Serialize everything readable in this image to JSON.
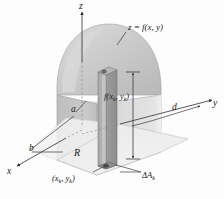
{
  "figure": {
    "labels": {
      "z_axis": "z",
      "y_axis": "y",
      "x_axis": "x",
      "surface_equation": "z = f(x, y)",
      "side_a": "a",
      "side_b": "b",
      "side_d": "d",
      "region": "R",
      "sample_point": "(x",
      "sample_point_sub1": "k",
      "sample_point_mid": ", y",
      "sample_point_sub2": "k",
      "sample_point_end": ")",
      "height_label": "f(x",
      "height_sub1": "k",
      "height_mid": ", y",
      "height_sub2": "k",
      "height_end": ")",
      "area_element": "ΔA",
      "area_element_sub": "k"
    },
    "colors": {
      "background": "#fdfdfd",
      "dome_fill": "#c9c9c9",
      "dome_fill_light": "#d6d6d6",
      "box_left_face": "#c4c4c4",
      "box_front_face": "#d0d0d0",
      "box_base": "#e8e8e8",
      "column_light": "#b5b5b5",
      "column_dark": "#9a9a9a",
      "stroke": "#4a4a4a",
      "text": "#1a1a1a"
    },
    "geometry": {
      "z_axis_tip": "109,6",
      "y_axis_tip": "214,101",
      "x_axis_tip": "12,160",
      "origin": "82,86"
    }
  }
}
